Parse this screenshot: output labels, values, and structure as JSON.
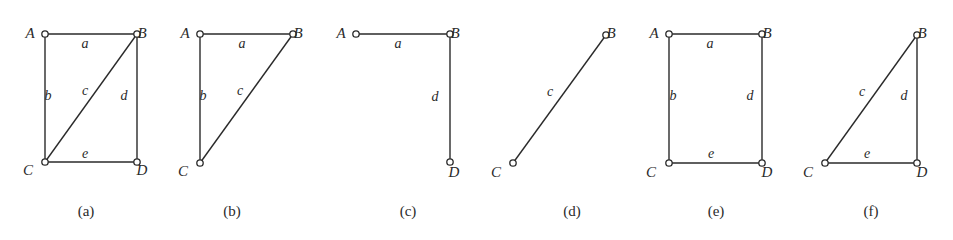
{
  "figure": {
    "panels": [
      {
        "id": "a",
        "caption": "(a)",
        "vertices": [
          {
            "name": "A",
            "x": 45,
            "y": 34,
            "lx": 30,
            "ly": 38
          },
          {
            "name": "B",
            "x": 137,
            "y": 34,
            "lx": 142,
            "ly": 38
          },
          {
            "name": "C",
            "x": 45,
            "y": 162,
            "lx": 28,
            "ly": 175
          },
          {
            "name": "D",
            "x": 137,
            "y": 162,
            "lx": 142,
            "ly": 175
          }
        ],
        "edges": [
          {
            "label": "a",
            "from": "A",
            "to": "B",
            "lx": 85,
            "ly": 48
          },
          {
            "label": "b",
            "from": "A",
            "to": "C",
            "lx": 48,
            "ly": 100
          },
          {
            "label": "c",
            "from": "C",
            "to": "B",
            "lx": 85,
            "ly": 95
          },
          {
            "label": "d",
            "from": "B",
            "to": "D",
            "lx": 124,
            "ly": 100
          },
          {
            "label": "e",
            "from": "C",
            "to": "D",
            "lx": 85,
            "ly": 158
          }
        ],
        "caption_x": 86,
        "caption_y": 216
      },
      {
        "id": "b",
        "caption": "(b)",
        "vertices": [
          {
            "name": "A",
            "x": 200,
            "y": 34,
            "lx": 185,
            "ly": 38
          },
          {
            "name": "B",
            "x": 293,
            "y": 34,
            "lx": 298,
            "ly": 38
          },
          {
            "name": "C",
            "x": 200,
            "y": 163,
            "lx": 183,
            "ly": 176
          }
        ],
        "edges": [
          {
            "label": "a",
            "from": "A",
            "to": "B",
            "lx": 242,
            "ly": 48
          },
          {
            "label": "b",
            "from": "A",
            "to": "C",
            "lx": 203,
            "ly": 100
          },
          {
            "label": "c",
            "from": "C",
            "to": "B",
            "lx": 240,
            "ly": 95
          }
        ],
        "caption_x": 232,
        "caption_y": 216
      },
      {
        "id": "c",
        "caption": "(c)",
        "vertices": [
          {
            "name": "A",
            "x": 356,
            "y": 34,
            "lx": 341,
            "ly": 38
          },
          {
            "name": "B",
            "x": 450,
            "y": 34,
            "lx": 455,
            "ly": 38
          },
          {
            "name": "D",
            "x": 450,
            "y": 162,
            "lx": 454,
            "ly": 177
          }
        ],
        "edges": [
          {
            "label": "a",
            "from": "A",
            "to": "B",
            "lx": 398,
            "ly": 48
          },
          {
            "label": "d",
            "from": "B",
            "to": "D",
            "lx": 435,
            "ly": 101
          }
        ],
        "caption_x": 408,
        "caption_y": 216
      },
      {
        "id": "d",
        "caption": "(d)",
        "vertices": [
          {
            "name": "B",
            "x": 606,
            "y": 35,
            "lx": 611,
            "ly": 38
          },
          {
            "name": "C",
            "x": 513,
            "y": 163,
            "lx": 496,
            "ly": 177
          }
        ],
        "edges": [
          {
            "label": "c",
            "from": "C",
            "to": "B",
            "lx": 550,
            "ly": 96
          }
        ],
        "caption_x": 572,
        "caption_y": 216
      },
      {
        "id": "e",
        "caption": "(e)",
        "vertices": [
          {
            "name": "A",
            "x": 669,
            "y": 34,
            "lx": 654,
            "ly": 38
          },
          {
            "name": "B",
            "x": 762,
            "y": 34,
            "lx": 767,
            "ly": 38
          },
          {
            "name": "C",
            "x": 669,
            "y": 163,
            "lx": 651,
            "ly": 177
          },
          {
            "name": "D",
            "x": 762,
            "y": 163,
            "lx": 767,
            "ly": 177
          }
        ],
        "edges": [
          {
            "label": "a",
            "from": "A",
            "to": "B",
            "lx": 710,
            "ly": 48
          },
          {
            "label": "b",
            "from": "A",
            "to": "C",
            "lx": 673,
            "ly": 100
          },
          {
            "label": "d",
            "from": "B",
            "to": "D",
            "lx": 750,
            "ly": 100
          },
          {
            "label": "e",
            "from": "C",
            "to": "D",
            "lx": 711,
            "ly": 158
          }
        ],
        "caption_x": 716,
        "caption_y": 216
      },
      {
        "id": "f",
        "caption": "(f)",
        "vertices": [
          {
            "name": "B",
            "x": 917,
            "y": 35,
            "lx": 922,
            "ly": 38
          },
          {
            "name": "C",
            "x": 825,
            "y": 163,
            "lx": 808,
            "ly": 177
          },
          {
            "name": "D",
            "x": 917,
            "y": 163,
            "lx": 922,
            "ly": 177
          }
        ],
        "edges": [
          {
            "label": "c",
            "from": "C",
            "to": "B",
            "lx": 862,
            "ly": 96
          },
          {
            "label": "d",
            "from": "B",
            "to": "D",
            "lx": 904,
            "ly": 100
          },
          {
            "label": "e",
            "from": "C",
            "to": "D",
            "lx": 867,
            "ly": 158
          }
        ],
        "caption_x": 871,
        "caption_y": 216
      }
    ]
  },
  "style": {
    "stroke_color": "#2a2a2a",
    "background": "#ffffff",
    "node_radius": 3.2
  }
}
